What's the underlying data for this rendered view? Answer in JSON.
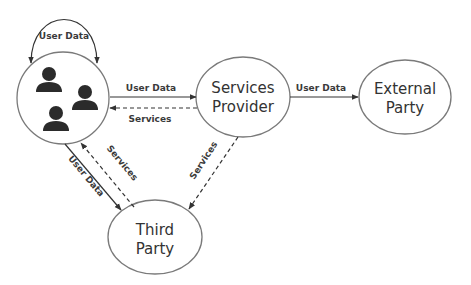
{
  "diagram": {
    "colors": {
      "stroke": "#7a7a7a",
      "arrow": "#333333",
      "icon": "#2b2b2b",
      "text": "#333333"
    },
    "nodes": {
      "users": {
        "label": "",
        "icon": "users-group-icon",
        "count": 3
      },
      "services_provider": {
        "line1": "Services",
        "line2": "Provider"
      },
      "external_party": {
        "line1": "External",
        "line2": "Party"
      },
      "third_party": {
        "line1": "Third",
        "line2": "Party"
      }
    },
    "edges": {
      "users_self_loop": {
        "label": "User Data",
        "style": "solid"
      },
      "users_to_provider": {
        "label": "User Data",
        "style": "solid"
      },
      "provider_to_users": {
        "label": "Services",
        "style": "dashed"
      },
      "provider_to_external": {
        "label": "User Data",
        "style": "solid"
      },
      "users_to_third": {
        "label": "User Data",
        "style": "solid"
      },
      "third_to_users": {
        "label": "Services",
        "style": "dashed"
      },
      "provider_to_third": {
        "label": "Services",
        "style": "dashed"
      }
    }
  }
}
